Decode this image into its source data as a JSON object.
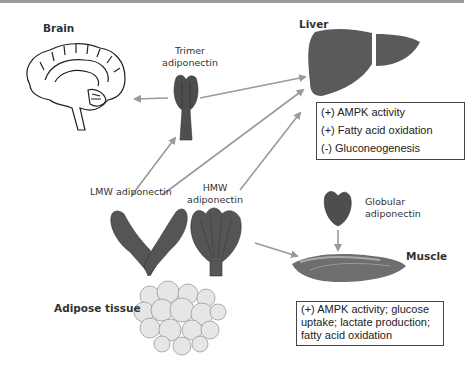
{
  "labels": {
    "brain": "Brain",
    "trimer": [
      "Trimer",
      "adiponectin"
    ],
    "liver": "Liver",
    "lmw": "LMW adiponectin",
    "hmw": [
      "HMW",
      "adiponectin"
    ],
    "globular": [
      "Globular",
      "adiponectin"
    ],
    "muscle": "Muscle",
    "adipose": "Adipose tissue"
  },
  "liver_effects": [
    "(+) AMPK activity",
    "(+) Fatty acid oxidation",
    "(-) Gluconeogenesis"
  ],
  "muscle_effects": [
    "(+) AMPK activity; glucose",
    "uptake; lactate production;",
    "fatty acid oxidation"
  ],
  "colors": {
    "organ_fill": "#5a5a5a",
    "protein_fill": "#4e4e4e",
    "arrow": "#9a9a9a",
    "adipose_fill": "#e6e6e6"
  }
}
